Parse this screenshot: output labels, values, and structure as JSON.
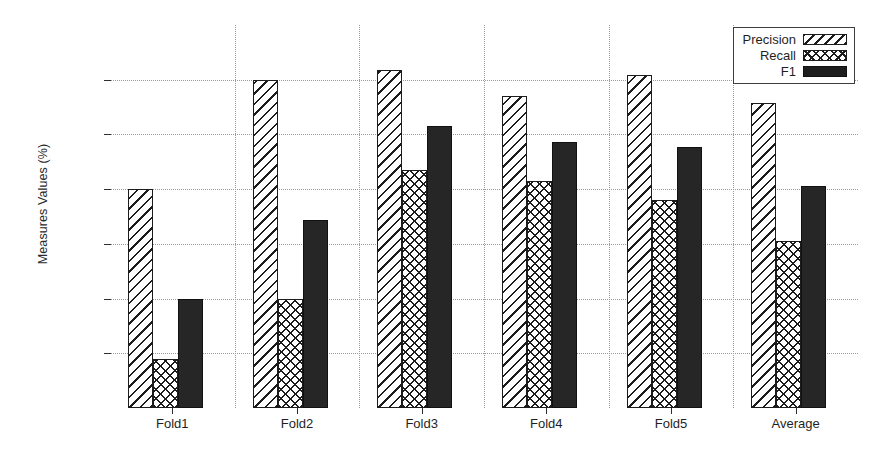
{
  "chart_data": {
    "type": "bar",
    "title": "",
    "xlabel": "",
    "ylabel": "Measures Values (%)",
    "categories": [
      "Fold1",
      "Fold2",
      "Fold3",
      "Fold4",
      "Fold5",
      "Average"
    ],
    "series": [
      {
        "name": "Precision",
        "values": [
          70.0,
          90.0,
          91.7,
          87.0,
          90.8,
          85.8
        ],
        "fill": "diagonal-hatch"
      },
      {
        "name": "Recall",
        "values": [
          39.0,
          50.0,
          73.5,
          71.5,
          68.0,
          60.5
        ],
        "fill": "cross-hatch"
      },
      {
        "name": "F1",
        "values": [
          50.0,
          64.3,
          81.6,
          78.6,
          77.7,
          70.6
        ],
        "fill": "solid-black"
      }
    ],
    "ylim": [
      30,
      100
    ],
    "yticks": [
      30,
      40,
      50,
      60,
      70,
      80,
      90,
      100
    ],
    "ytick_labels": [
      "30",
      "40",
      "50",
      "60",
      "70",
      "80",
      "90",
      "100"
    ],
    "grid": true,
    "grid_style": "dotted",
    "legend_position": "top-right",
    "colors": {
      "ink": "#1c1c1c",
      "frame": "#3d3d3d",
      "grid": "#9a9a9a",
      "background": "#ffffff",
      "f1_fill": "#262626"
    }
  },
  "legend": {
    "entries": [
      {
        "label": "Precision",
        "swatch": "precision"
      },
      {
        "label": "Recall",
        "swatch": "recall"
      },
      {
        "label": "F1",
        "swatch": "f1"
      }
    ]
  },
  "axes": {
    "y_title": "Measures Values (%)"
  }
}
